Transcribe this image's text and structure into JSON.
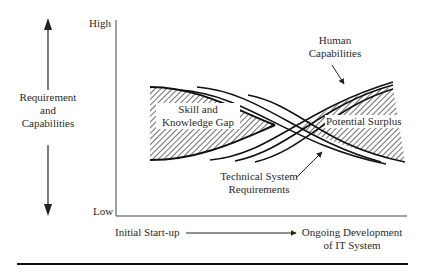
{
  "diagram": {
    "y_axis": {
      "title_lines": [
        "Requirement",
        "and",
        "Capabilities"
      ],
      "high_label": "High",
      "low_label": "Low"
    },
    "x_axis": {
      "start_label": "Initial Start-up",
      "end_label_lines": [
        "Ongoing Development",
        "of IT System"
      ]
    },
    "regions": {
      "gap_label_lines": [
        "Skill and",
        "Knowledge Gap"
      ],
      "surplus_label": "Potential Surplus"
    },
    "curves": {
      "human_label_lines": [
        "Human",
        "Capabilities"
      ],
      "technical_label_lines": [
        "Technical System",
        "Requirements"
      ]
    },
    "colors": {
      "ink": "#222222",
      "background": "#ffffff"
    }
  }
}
